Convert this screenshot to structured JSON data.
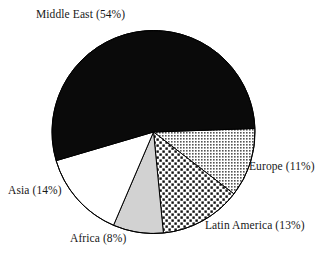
{
  "chart_data": {
    "type": "pie",
    "title": "",
    "subtitle": "",
    "xlabel": "",
    "ylabel": "",
    "legend_position": "none",
    "grid": false,
    "units": "percent",
    "total": 100,
    "start_angle_deg": -2,
    "direction": "clockwise",
    "categories": [
      "Middle East",
      "Europe",
      "Latin America",
      "Africa",
      "Asia"
    ],
    "values": [
      54,
      11,
      13,
      8,
      14
    ],
    "labels": [
      "Middle East (54%)",
      "Europe (11%)",
      "Latin America (13%)",
      "Africa (8%)",
      "Asia (14%)"
    ],
    "slices": [
      {
        "name": "Middle East",
        "label": "Middle East (54%)",
        "value": 54,
        "fill_style": "solid-black",
        "fill_color": "#0a0a0a",
        "stroke_color": "#000000"
      },
      {
        "name": "Europe",
        "label": "Europe (11%)",
        "value": 11,
        "fill_style": "fine-grid-gray",
        "fill_color": "#9a9a9a",
        "stroke_color": "#000000"
      },
      {
        "name": "Latin America",
        "label": "Latin America (13%)",
        "value": 13,
        "fill_style": "checker-dots",
        "fill_color": "#1a1a1a",
        "stroke_color": "#000000"
      },
      {
        "name": "Africa",
        "label": "Africa (8%)",
        "value": 8,
        "fill_style": "solid-light-gray",
        "fill_color": "#d2d2d2",
        "stroke_color": "#000000"
      },
      {
        "name": "Asia",
        "label": "Asia (14%)",
        "value": 14,
        "fill_style": "solid-white",
        "fill_color": "#ffffff",
        "stroke_color": "#000000"
      }
    ]
  },
  "labels": {
    "middle_east": "Middle East (54%)",
    "europe": "Europe (11%)",
    "latin_america": "Latin America (13%)",
    "africa": "Africa (8%)",
    "asia": "Asia (14%)"
  },
  "colors": {
    "background": "#ffffff",
    "outline": "#000000",
    "text": "#171717",
    "middle_east": "#0a0a0a",
    "europe": "#9a9a9a",
    "latin_america": "#1a1a1a",
    "africa": "#d2d2d2",
    "asia": "#ffffff"
  }
}
